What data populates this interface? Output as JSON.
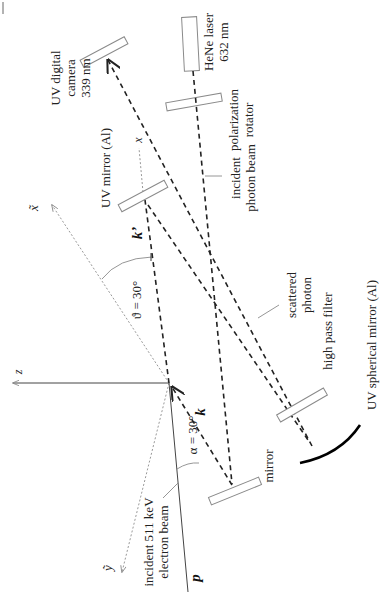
{
  "diagram": {
    "type": "optical-setup",
    "components": {
      "uv_camera": {
        "label_line1": "UV digital",
        "label_line2": "camera",
        "label_line3": "339 nm"
      },
      "laser": {
        "label_line1": "HeNe laser",
        "label_line2": "632 nm"
      },
      "polarization_rotator": {
        "label_line1": "polarization",
        "label_line2": "rotator"
      },
      "uv_mirror": {
        "label": "UV mirror (Al)"
      },
      "incident_photon_beam": {
        "label_line1": "incident",
        "label_line2": "photon beam"
      },
      "scattered_photon": {
        "label_line1": "scattered",
        "label_line2": "photon"
      },
      "high_pass_filter": {
        "label": "high pass filter"
      },
      "spherical_mirror": {
        "label": "UV spherical mirror (Al)"
      },
      "mirror": {
        "label": "mirror"
      },
      "electron_beam": {
        "label_line1": "incident 511 keV",
        "label_line2": "electron beam"
      }
    },
    "axes": {
      "z": "z",
      "x": "x",
      "x_tilde": "x̃",
      "y_tilde": "ỹ"
    },
    "vectors": {
      "k": "k",
      "k_prime": "k’",
      "p": "p"
    },
    "angles": {
      "theta": "ϑ = 30°",
      "alpha": "α = 30°"
    },
    "colors": {
      "beam": "#222222",
      "axis": "#9a9a9a",
      "optic_outline": "#8a8a8a",
      "spherical_mirror": "#000000"
    }
  }
}
